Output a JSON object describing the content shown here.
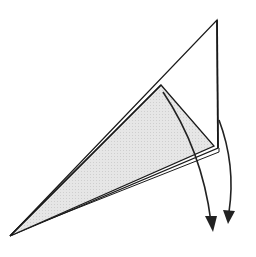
{
  "diagram": {
    "type": "origami-fold-step",
    "colors": {
      "background": "#ffffff",
      "outline": "#1a1a1a",
      "paper_back": "#e3e3e3",
      "paper_front": "#ffffff",
      "arrow": "#222222"
    },
    "shapes": {
      "outer_flap": [
        [
          217,
          20
        ],
        [
          218,
          148
        ],
        [
          10,
          236
        ]
      ],
      "shaded_layer": [
        [
          161,
          85
        ],
        [
          214,
          146
        ],
        [
          10,
          236
        ]
      ],
      "inner_layer_edge": [
        [
          12,
          234
        ],
        [
          219,
          152
        ]
      ]
    },
    "arrows": [
      {
        "name": "fold-arrow-inner",
        "from": [
          163,
          92
        ],
        "ctrl": [
          200,
          150
        ],
        "to": [
          213,
          232
        ]
      },
      {
        "name": "fold-arrow-outer",
        "from": [
          219,
          120
        ],
        "ctrl": [
          236,
          170
        ],
        "to": [
          228,
          222
        ]
      }
    ]
  }
}
